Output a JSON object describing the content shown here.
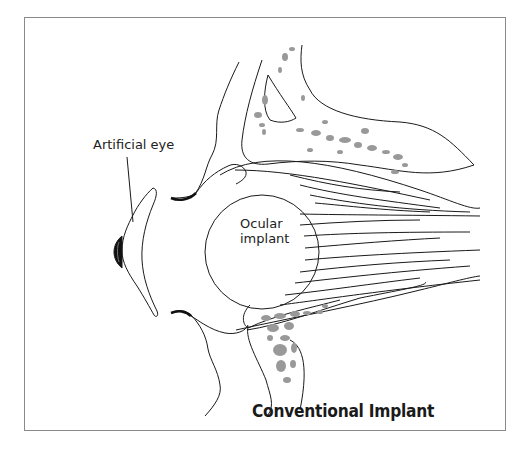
{
  "figure": {
    "title": "Conventional Implant",
    "labels": {
      "artificial_eye": "Artificial eye",
      "ocular_implant_line1": "Ocular",
      "ocular_implant_line2": "implant"
    },
    "colors": {
      "stroke": "#1a1a1a",
      "bone_fill": "#999999",
      "border": "#8a8a8a",
      "background": "#ffffff"
    }
  }
}
